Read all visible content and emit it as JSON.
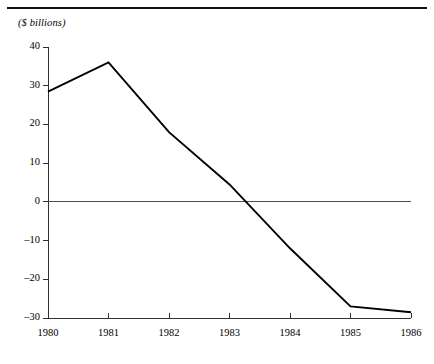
{
  "page": {
    "background_color": "#ffffff",
    "rule_color": "#101010"
  },
  "chart_data": {
    "type": "line",
    "title": "",
    "subtitle": "",
    "unit_label": "($ billions)",
    "xlabel": "",
    "ylabel": "",
    "categories": [
      "1980",
      "1981",
      "1982",
      "1983",
      "1984",
      "1985",
      "1986"
    ],
    "x": [
      1980,
      1981,
      1982,
      1983,
      1984,
      1985,
      1986
    ],
    "values": [
      28.5,
      36.0,
      18.0,
      4.5,
      -12.0,
      -27.0,
      -28.5
    ],
    "series": [
      {
        "name": "balance",
        "values": [
          28.5,
          36.0,
          18.0,
          4.5,
          -12.0,
          -27.0,
          -28.5
        ],
        "color": "#000000",
        "line_width": 1.9
      }
    ],
    "xlim": [
      1980,
      1986
    ],
    "ylim": [
      -30,
      40
    ],
    "ytick_labels": [
      "40",
      "30",
      "20",
      "10",
      "0",
      "–10",
      "–20",
      "–30"
    ],
    "ytick_values": [
      40,
      30,
      20,
      10,
      0,
      -10,
      -20,
      -30
    ],
    "xtick_labels": [
      "1980",
      "1981",
      "1982",
      "1983",
      "1984",
      "1985",
      "1986"
    ],
    "grid": false,
    "zero_line": true,
    "zero_line_value": 0,
    "legend": null,
    "legend_position": "none",
    "annotations": [],
    "axis_color": "#303030",
    "zero_line_color": "#505050"
  }
}
